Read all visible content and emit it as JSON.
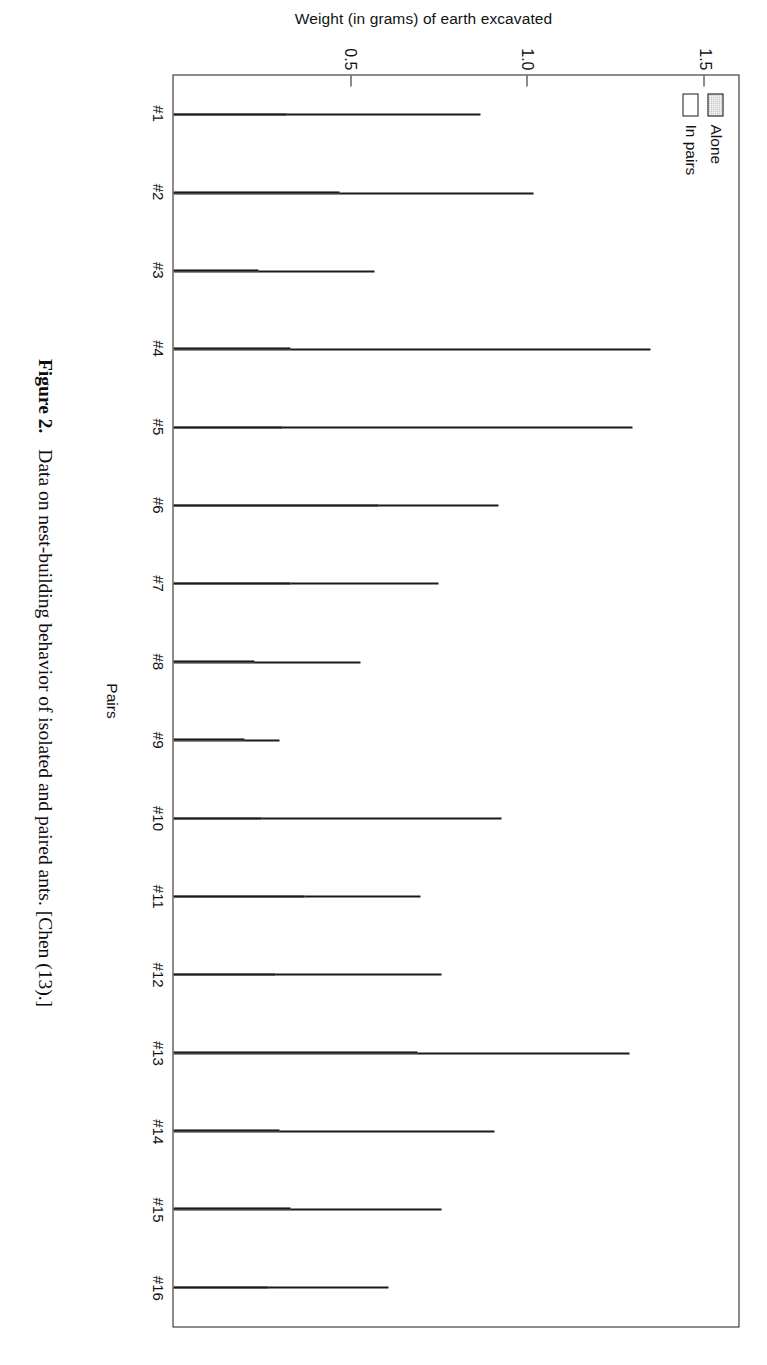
{
  "figure": {
    "caption_label": "Figure 2.",
    "caption_text": "Data on nest-building behavior of isolated and paired ants. [Chen (13).]"
  },
  "legend": {
    "position": "upper-left-inside",
    "entries": [
      {
        "label": "Alone",
        "swatch": "gray-stipple",
        "color": "#c9c9c9"
      },
      {
        "label": "In pairs",
        "swatch": "white-outline",
        "color": "#ffffff"
      }
    ]
  },
  "axes": {
    "value_axis_title": "Weight (in grams) of earth excavated",
    "category_axis_title": "Pairs",
    "value_ticks": [
      "0.5",
      "1.0",
      "1.5"
    ],
    "value_tick_numbers": [
      0.5,
      1.0,
      1.5
    ],
    "value_min": 0,
    "value_max": 1.6
  },
  "chart_data": {
    "type": "bar",
    "orientation": "vertical-grouped",
    "title": "",
    "xlabel": "Pairs",
    "ylabel": "Weight (in grams) of earth excavated",
    "ylim": [
      0,
      1.6
    ],
    "yticks": [
      0.5,
      1.0,
      1.5
    ],
    "grid": false,
    "legend_position": "upper left (inside axes)",
    "categories": [
      "#1",
      "#2",
      "#3",
      "#4",
      "#5",
      "#6",
      "#7",
      "#8",
      "#9",
      "#10",
      "#11",
      "#12",
      "#13",
      "#14",
      "#15",
      "#16"
    ],
    "series": [
      {
        "name": "Alone",
        "fill": "gray-stipple",
        "values": [
          0.32,
          0.47,
          0.24,
          0.33,
          0.31,
          0.58,
          0.33,
          0.23,
          0.2,
          0.25,
          0.37,
          0.29,
          0.69,
          0.3,
          0.33,
          0.27
        ]
      },
      {
        "name": "In pairs",
        "fill": "white",
        "values": [
          0.87,
          1.02,
          0.57,
          1.35,
          1.3,
          0.92,
          0.75,
          0.53,
          0.3,
          0.93,
          0.7,
          0.76,
          1.29,
          0.91,
          0.76,
          0.61
        ]
      }
    ]
  }
}
